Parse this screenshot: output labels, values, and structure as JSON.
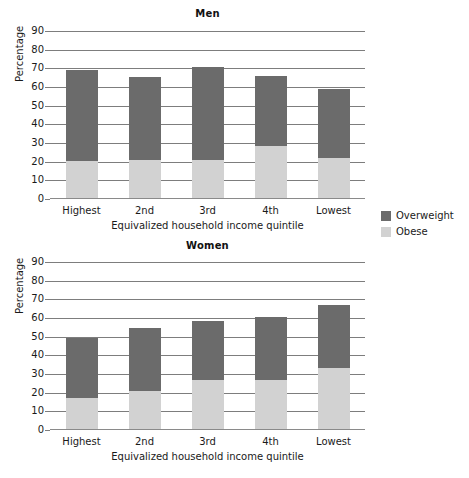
{
  "colors": {
    "overweight": "#6b6b6b",
    "obese": "#d2d2d2",
    "axis": "#7d7d7d",
    "text": "#1a1a1a",
    "background": "#ffffff"
  },
  "legend": {
    "items": [
      {
        "label": "Overweight",
        "color": "#6b6b6b"
      },
      {
        "label": "Obese",
        "color": "#d2d2d2"
      }
    ]
  },
  "panels": [
    {
      "id": "men",
      "title": "Men"
    },
    {
      "id": "women",
      "title": "Women"
    }
  ],
  "axis": {
    "ylabel": "Percentage",
    "xlabel": "Equivalized household income quintile",
    "yticks": [
      "0",
      "10",
      "20",
      "30",
      "40",
      "50",
      "60",
      "70",
      "80",
      "90"
    ]
  },
  "chart_data": [
    {
      "type": "bar",
      "stacked": true,
      "title": "Men",
      "xlabel": "Equivalized household income quintile",
      "ylabel": "Percentage",
      "ylim": [
        0,
        90
      ],
      "yticks": [
        0,
        10,
        20,
        30,
        40,
        50,
        60,
        70,
        80,
        90
      ],
      "grid": true,
      "categories": [
        "Highest",
        "2nd",
        "3rd",
        "4th",
        "Lowest"
      ],
      "series": [
        {
          "name": "Obese",
          "values": [
            20,
            20.5,
            20.5,
            28,
            21.5
          ]
        },
        {
          "name": "Overweight",
          "values": [
            48.5,
            44.5,
            49.5,
            37.5,
            37
          ]
        }
      ],
      "totals": [
        68.5,
        65,
        70,
        65.5,
        58.5
      ]
    },
    {
      "type": "bar",
      "stacked": true,
      "title": "Women",
      "xlabel": "Equivalized household income quintile",
      "ylabel": "Percentage",
      "ylim": [
        0,
        90
      ],
      "yticks": [
        0,
        10,
        20,
        30,
        40,
        50,
        60,
        70,
        80,
        90
      ],
      "grid": true,
      "categories": [
        "Highest",
        "2nd",
        "3rd",
        "4th",
        "Lowest"
      ],
      "series": [
        {
          "name": "Obese",
          "values": [
            16.5,
            20.5,
            26.5,
            26.5,
            32.5
          ]
        },
        {
          "name": "Overweight",
          "values": [
            32,
            33.5,
            31.5,
            33.5,
            34
          ]
        }
      ],
      "totals": [
        48.5,
        54,
        58,
        60,
        66.5
      ]
    }
  ]
}
